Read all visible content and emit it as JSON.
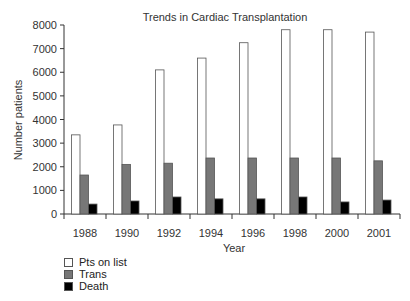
{
  "chart_data": {
    "type": "bar",
    "title": "Trends in Cardiac Transplantation",
    "xlabel": "Year",
    "ylabel": "Number patients",
    "categories": [
      "1988",
      "1990",
      "1992",
      "1994",
      "1996",
      "1998",
      "2000",
      "2001"
    ],
    "series": [
      {
        "name": "Pts on list",
        "color": "#ffffff",
        "values": [
          3350,
          3770,
          6100,
          6600,
          7250,
          7800,
          7800,
          7700
        ]
      },
      {
        "name": "Trans",
        "color": "#777777",
        "values": [
          1650,
          2100,
          2150,
          2370,
          2370,
          2370,
          2370,
          2250
        ]
      },
      {
        "name": "Death",
        "color": "#000000",
        "values": [
          420,
          550,
          720,
          640,
          640,
          720,
          510,
          590
        ]
      }
    ],
    "ylim": [
      0,
      8000
    ],
    "yticks": [
      0,
      1000,
      2000,
      3000,
      4000,
      5000,
      6000,
      7000,
      8000
    ],
    "grid": false,
    "legend_position": "bottom-left"
  }
}
